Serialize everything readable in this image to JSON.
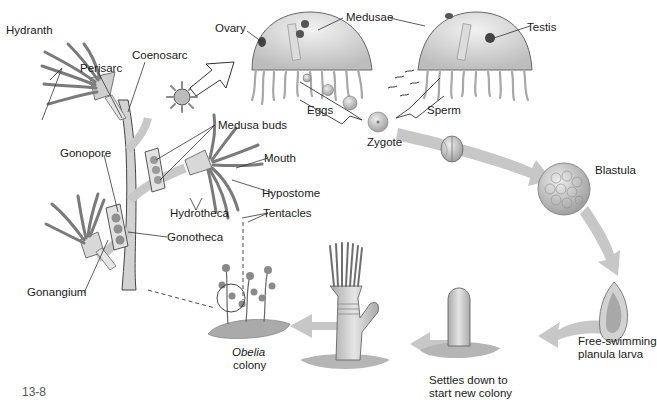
{
  "figure": {
    "figure_number": "13-8",
    "colors": {
      "background": "#ffffff",
      "arrow_fill": "#c4c4c4",
      "tissue": "#b8b8b8",
      "outline": "#333333",
      "label_text": "#1a1a1a"
    }
  },
  "labels": {
    "hydranth": "Hydranth",
    "perisarc": "Perisarc",
    "coenosarc": "Coenosarc",
    "ovary": "Ovary",
    "medusae": "Medusae",
    "testis": "Testis",
    "eggs": "Eggs",
    "sperm": "Sperm",
    "zygote": "Zygote",
    "medusa_buds": "Medusa buds",
    "mouth": "Mouth",
    "hypostome": "Hypostome",
    "hydrotheca": "Hydrotheca",
    "tentacles": "Tentacles",
    "gonopore": "Gonopore",
    "gonotheca": "Gonotheca",
    "gonangium": "Gonangium",
    "blastula": "Blastula",
    "planula_line1": "Free-swimming",
    "planula_line2": "planula larva",
    "settles_line1": "Settles down to",
    "settles_line2": "start new colony",
    "obelia_line1": "Obelia",
    "obelia_line2": "colony"
  },
  "stages": [
    {
      "name": "Medusae",
      "order": 1
    },
    {
      "name": "Zygote",
      "order": 2
    },
    {
      "name": "Cleavage embryo",
      "order": 3
    },
    {
      "name": "Blastula",
      "order": 4
    },
    {
      "name": "Free-swimming planula larva",
      "order": 5
    },
    {
      "name": "Settles down to start new colony",
      "order": 6
    },
    {
      "name": "Young polyp",
      "order": 7
    },
    {
      "name": "Obelia colony",
      "order": 8
    }
  ]
}
